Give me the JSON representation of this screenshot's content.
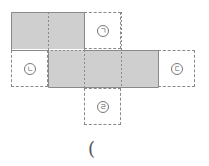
{
  "diagram": {
    "cell_size": 37,
    "origin": {
      "x": 11,
      "y": 12
    },
    "shaded_color": "#cfcfcf",
    "line_color": "#8a8a8a",
    "labels": {
      "giyeok": "ㄱ",
      "nieun": "ㄴ",
      "digeut": "ㄷ",
      "rieul": "ㄹ"
    },
    "cells": [
      {
        "row": 0,
        "col": 0,
        "type": "shaded"
      },
      {
        "row": 0,
        "col": 1,
        "type": "shaded"
      },
      {
        "row": 0,
        "col": 2,
        "type": "dashed",
        "label": "ㄱ"
      },
      {
        "row": 1,
        "col": 0,
        "type": "dashed",
        "label": "ㄴ"
      },
      {
        "row": 1,
        "col": 1,
        "type": "shaded"
      },
      {
        "row": 1,
        "col": 2,
        "type": "shaded"
      },
      {
        "row": 1,
        "col": 3,
        "type": "shaded"
      },
      {
        "row": 1,
        "col": 4,
        "type": "dashed",
        "label": "ㄷ"
      },
      {
        "row": 2,
        "col": 2,
        "type": "dashed",
        "label": "ㄹ"
      }
    ]
  },
  "answer": {
    "open_paren": "("
  }
}
